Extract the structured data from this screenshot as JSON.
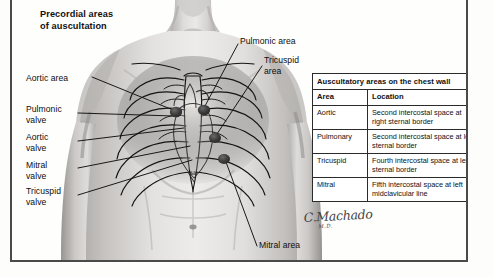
{
  "title": "Precordial areas\nof auscultation",
  "callouts": [
    {
      "name": "aortic-area",
      "text": "Aortic area",
      "x": 14,
      "y": 73,
      "align": "left",
      "width": 72
    },
    {
      "name": "pulmonic-valve",
      "text": "Pulmonic\nvalve",
      "x": 14,
      "y": 104,
      "align": "left",
      "width": 62
    },
    {
      "name": "aortic-valve",
      "text": "Aortic\nvalve",
      "x": 14,
      "y": 132,
      "align": "left",
      "width": 62
    },
    {
      "name": "mitral-valve",
      "text": "Mitral\nvalve",
      "x": 14,
      "y": 160,
      "align": "left",
      "width": 62
    },
    {
      "name": "tricuspid-valve",
      "text": "Tricuspid\nvalve",
      "x": 14,
      "y": 186,
      "align": "left",
      "width": 62
    },
    {
      "name": "pulmonic-area",
      "text": "Pulmonic area",
      "x": 228,
      "y": 36,
      "align": "left",
      "width": 80
    },
    {
      "name": "tricuspid-area",
      "text": "Tricuspid\narea",
      "x": 252,
      "y": 55,
      "align": "left",
      "width": 56
    },
    {
      "name": "mitral-area",
      "text": "Mitral area",
      "x": 247,
      "y": 247,
      "align": "left",
      "width": 68
    }
  ],
  "table": {
    "title": "Auscultatory areas on the chest wall",
    "columns": [
      "Area",
      "Location"
    ],
    "rows": [
      {
        "area": "Aortic",
        "location": "Second intercostal space at right sternal border"
      },
      {
        "area": "Pulmonary",
        "location": "Second intercostal space at left sternal border"
      },
      {
        "area": "Tricuspid",
        "location": "Fourth intercostal space at left sternal border"
      },
      {
        "area": "Mitral",
        "location": "Fifth intercostal space at left midclavicular line"
      }
    ]
  },
  "signature": {
    "name": "C.Machado",
    "credential": "M.D."
  },
  "colors": {
    "frame_border": "#4a4a4a",
    "table_border": "#2b2b2b",
    "marker_dot": "#3a3a3a",
    "leader_line": "#1a1a1a",
    "skin_light": "#e9e7e5",
    "skin_mid": "#c9c6c4",
    "skin_shadow": "#9d9b99",
    "page_background": "#ffffff"
  },
  "markers": [
    {
      "name": "aortic-area-dot",
      "x": 164,
      "y": 112
    },
    {
      "name": "pulmonic-area-dot",
      "x": 192,
      "y": 110
    },
    {
      "name": "tricuspid-area-dot",
      "x": 203,
      "y": 138
    },
    {
      "name": "mitral-area-dot",
      "x": 212,
      "y": 159
    }
  ]
}
